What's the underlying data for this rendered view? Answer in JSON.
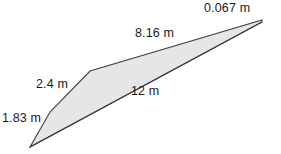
{
  "figure": {
    "type": "quadrilateral",
    "unit": "m",
    "fill_color": "#e6e6e6",
    "stroke_color": "#404040",
    "background_color": "#ffffff",
    "text_color": "#1a1a1a",
    "vertices": [
      {
        "name": "bottom-left-point",
        "x": 30,
        "y": 147
      },
      {
        "name": "left-bend",
        "x": 50,
        "y": 112
      },
      {
        "name": "upper-middle-bend",
        "x": 90,
        "y": 71
      },
      {
        "name": "right-point",
        "x": 262,
        "y": 20
      }
    ],
    "sides": [
      {
        "id": "side-183",
        "label": "1.83 m",
        "value": 1.83,
        "from": "bottom-left-point",
        "to": "left-bend"
      },
      {
        "id": "side-24",
        "label": "2.4 m",
        "value": 2.4,
        "from": "left-bend",
        "to": "upper-middle-bend"
      },
      {
        "id": "side-816",
        "label": "8.16 m",
        "value": 8.16,
        "from": "upper-middle-bend",
        "to": "right-point"
      },
      {
        "id": "side-0067",
        "label": "0.067 m",
        "value": 0.067,
        "from": "right-point",
        "to": "right-point-lower"
      },
      {
        "id": "side-12",
        "label": "12 m",
        "value": 12,
        "from": "right-point",
        "to": "bottom-left-point"
      }
    ],
    "labels": {
      "side_0067": "0.067 m",
      "side_816": "8.16 m",
      "side_24": "2.4 m",
      "side_12": "12 m",
      "side_183": "1.83 m"
    }
  }
}
